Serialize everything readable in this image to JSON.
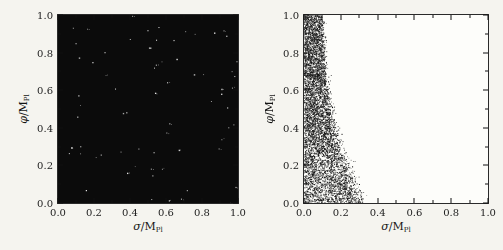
{
  "figure": {
    "background_color": "#f5f4ef",
    "frame_color": "#2a2a2a",
    "text_color": "#1b1b1b",
    "left_panel_fill": "#0b0b0b",
    "right_panel_fill": "#fdfdfa"
  },
  "axes": {
    "xlabel": {
      "symbol": "σ",
      "rest": "/M",
      "sub": "Pl"
    },
    "ylabel": {
      "symbol": "φ",
      "rest": "/M",
      "sub": "Pl"
    },
    "xtick_labels": [
      "0.0",
      "0.2",
      "0.4",
      "0.6",
      "0.8",
      "1.0"
    ],
    "ytick_labels": [
      "0.0",
      "0.2",
      "0.4",
      "0.6",
      "0.8",
      "1.0"
    ],
    "xlim": [
      0,
      1
    ],
    "ylim": [
      0,
      1
    ]
  },
  "chart_data": [
    {
      "type": "scatter",
      "panel": "left",
      "title": "",
      "xlabel": "sigma/M_Pl",
      "ylabel": "phi/M_Pl",
      "xlim": [
        0,
        1
      ],
      "ylim": [
        0,
        1
      ],
      "xticks": [
        0.0,
        0.2,
        0.4,
        0.6,
        0.8,
        1.0
      ],
      "yticks": [
        0.0,
        0.2,
        0.4,
        0.6,
        0.8,
        1.0
      ],
      "description": "Points densely fill the entire unit square (appears solid black) with sparse white speckle gaps scattered uniformly",
      "filled_region": "0 <= sigma <= 1, 0 <= phi <= 1",
      "filled_fraction": 1.0,
      "white_speckle_count": 70
    },
    {
      "type": "scatter",
      "panel": "right",
      "title": "",
      "xlabel": "sigma/M_Pl",
      "ylabel": "phi/M_Pl",
      "xlim": [
        0,
        1
      ],
      "ylim": [
        0,
        1
      ],
      "xticks": [
        0.0,
        0.2,
        0.4,
        0.6,
        0.8,
        1.0
      ],
      "yticks": [
        0.0,
        0.2,
        0.4,
        0.6,
        0.8,
        1.0
      ],
      "description": "Points densely fill a band along sigma=0 whose fuzzy right boundary sigma_max shrinks as phi grows",
      "filled_region": "0 <= sigma <= sigma_max(phi)",
      "boundary_phi": [
        0.0,
        0.05,
        0.1,
        0.2,
        0.3,
        0.4,
        0.5,
        0.6,
        0.7,
        0.8,
        0.9,
        1.0
      ],
      "boundary_sigma_max": [
        0.295,
        0.28,
        0.26,
        0.22,
        0.18,
        0.15,
        0.13,
        0.12,
        0.11,
        0.105,
        0.1,
        0.095
      ],
      "edge_fuzz_sigma": 0.035,
      "n_points": 9000
    }
  ]
}
